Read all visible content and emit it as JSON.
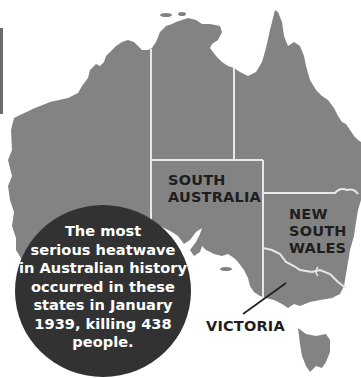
{
  "map": {
    "title": "Australia heatwave map",
    "colors": {
      "land": "#838383",
      "border": "#e8e8e8",
      "callout": "#323232",
      "callout_text": "#ffffff",
      "label_text": "#1e1e1e",
      "water": "#ffffff"
    },
    "state_labels": {
      "south_australia": [
        "SOUTH",
        "AUSTRALIA"
      ],
      "new_south_wales": [
        "NEW",
        "SOUTH",
        "WALES"
      ],
      "victoria": [
        "VICTORIA"
      ]
    },
    "callout": {
      "lines": [
        "The most",
        "serious heatwave",
        "in Australian history",
        "occurred in these",
        "states in January",
        "1939, killing 438",
        "people."
      ]
    }
  }
}
